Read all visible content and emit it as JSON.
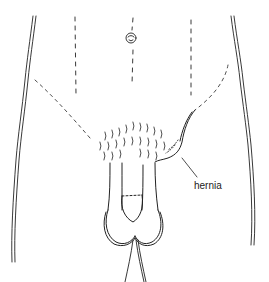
{
  "figure": {
    "labels": [
      {
        "text": "hernia",
        "x": 194,
        "y": 181
      }
    ],
    "colors": {
      "ink": "#222222",
      "background": "#ffffff"
    }
  }
}
